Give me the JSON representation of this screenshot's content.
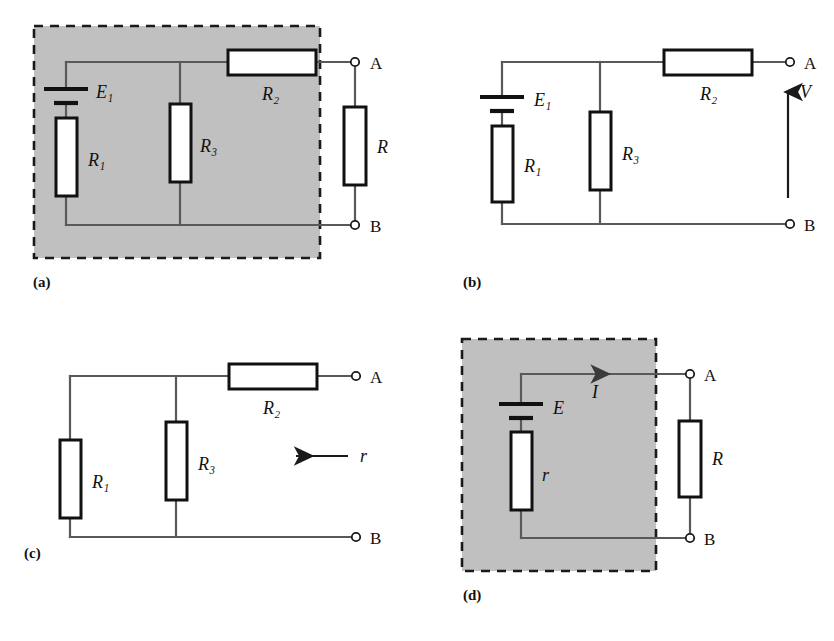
{
  "figure": {
    "type": "circuit-diagram",
    "background": "#ffffff",
    "shade_color": "#c0c0c0",
    "wire_color": "#595959",
    "component_color": "#111111",
    "panels": [
      {
        "id": "a",
        "label": "(a)",
        "shaded": true,
        "components": [
          {
            "name": "battery",
            "label": "E₁"
          },
          {
            "name": "resistor-r1",
            "label": "R₁"
          },
          {
            "name": "resistor-r3",
            "label": "R₃"
          },
          {
            "name": "resistor-r2",
            "label": "R₂"
          },
          {
            "name": "resistor-r",
            "label": "R"
          }
        ],
        "terminals": [
          "A",
          "B"
        ]
      },
      {
        "id": "b",
        "label": "(b)",
        "shaded": false,
        "components": [
          {
            "name": "battery",
            "label": "E₁"
          },
          {
            "name": "resistor-r1",
            "label": "R₁"
          },
          {
            "name": "resistor-r3",
            "label": "R₃"
          },
          {
            "name": "resistor-r2",
            "label": "R₂"
          }
        ],
        "terminals": [
          "A",
          "B"
        ],
        "annotation": {
          "name": "voltage-arrow",
          "label": "V",
          "direction": "up"
        }
      },
      {
        "id": "c",
        "label": "(c)",
        "shaded": false,
        "components": [
          {
            "name": "resistor-r1",
            "label": "R₁"
          },
          {
            "name": "resistor-r3",
            "label": "R₃"
          },
          {
            "name": "resistor-r2",
            "label": "R₂"
          }
        ],
        "terminals": [
          "A",
          "B"
        ],
        "annotation": {
          "name": "resistance-arrow",
          "label": "r",
          "direction": "left"
        }
      },
      {
        "id": "d",
        "label": "(d)",
        "shaded": true,
        "components": [
          {
            "name": "battery",
            "label": "E"
          },
          {
            "name": "resistor-r-internal",
            "label": "r"
          },
          {
            "name": "resistor-r",
            "label": "R"
          }
        ],
        "terminals": [
          "A",
          "B"
        ],
        "annotation": {
          "name": "current-arrow",
          "label": "I",
          "direction": "right"
        }
      }
    ],
    "labels": {
      "E1": "E₁",
      "E": "E",
      "R1": "R₁",
      "R2": "R₂",
      "R3": "R₃",
      "R": "R",
      "r": "r",
      "V": "V",
      "I": "I",
      "A": "A",
      "B": "B",
      "panel_a": "(a)",
      "panel_b": "(b)",
      "panel_c": "(c)",
      "panel_d": "(d)"
    }
  }
}
